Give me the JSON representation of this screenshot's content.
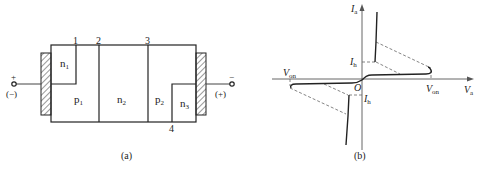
{
  "panel_a": {
    "caption": "(a)",
    "boundary_labels": [
      "1",
      "2",
      "3",
      "4"
    ],
    "regions": {
      "n1": {
        "main": "n",
        "sub": "1"
      },
      "p1": {
        "main": "p",
        "sub": "1"
      },
      "n2": {
        "main": "n",
        "sub": "2"
      },
      "p2": {
        "main": "p",
        "sub": "2"
      },
      "n3": {
        "main": "n",
        "sub": "3"
      }
    },
    "left_terminal": {
      "sign": "+",
      "alt_sign": "(−)"
    },
    "right_terminal": {
      "sign": "−",
      "alt_sign": "(+)"
    }
  },
  "panel_b": {
    "caption": "(b)",
    "y_axis": {
      "main": "I",
      "sub": "a"
    },
    "x_axis": {
      "main": "V",
      "sub": "a"
    },
    "origin": "O",
    "ih_top": {
      "main": "I",
      "sub": "h"
    },
    "ih_bottom": {
      "main": "I",
      "sub": "h"
    },
    "von_right": {
      "main": "V",
      "sub": "on"
    },
    "von_left": {
      "main": "V",
      "sub": "on"
    }
  },
  "colors": {
    "line": "#222222",
    "dash": "#555555"
  }
}
